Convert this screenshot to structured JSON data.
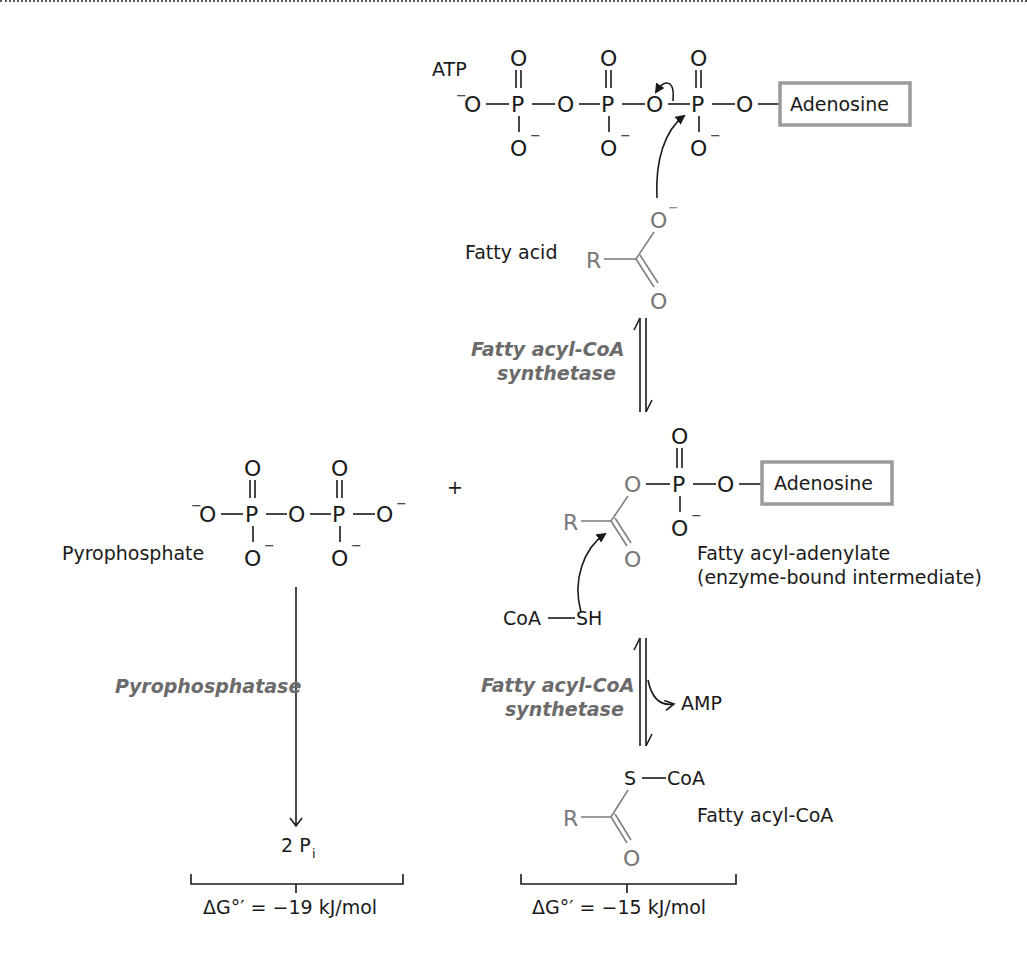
{
  "figure": {
    "atp": {
      "label": "ATP",
      "adenosine_label": "Adenosine",
      "atoms": {
        "O": "O",
        "P": "P",
        "neg": "−"
      }
    },
    "fatty_acid": {
      "label": "Fatty acid",
      "R": "R",
      "O": "O",
      "neg": "−"
    },
    "step1": {
      "enzyme_line1": "Fatty acyl-CoA",
      "enzyme_line2": "synthetase"
    },
    "adenylate": {
      "adenosine_label": "Adenosine",
      "label_line1": "Fatty acyl-adenylate",
      "label_line2": "(enzyme-bound intermediate)",
      "R": "R"
    },
    "plus": "+",
    "pyrophosphate": {
      "label": "Pyrophosphate"
    },
    "pyrophosphatase": {
      "enzyme": "Pyrophosphatase",
      "product_coef": "2 P",
      "product_sub": "i"
    },
    "coa": {
      "label": "CoA—SH",
      "coa_text": "CoA",
      "sh_text": "SH"
    },
    "step2": {
      "enzyme_line1": "Fatty acyl-CoA",
      "enzyme_line2": "synthetase",
      "byproduct": "AMP"
    },
    "acyl_coa": {
      "label": "Fatty acyl-CoA",
      "S": "S",
      "CoA": "CoA",
      "R": "R",
      "O": "O"
    },
    "energetics": {
      "left": {
        "prefix": "ΔG°′ = ",
        "value": "−19",
        "unit": " kJ/mol"
      },
      "right": {
        "prefix": "ΔG°′ = ",
        "value": "−15",
        "unit": " kJ/mol"
      }
    },
    "colors": {
      "text": "#1a1a1a",
      "gray_struct": "#808080",
      "enzyme": "#6b6b6b",
      "box_border": "#9a9a9a"
    }
  }
}
